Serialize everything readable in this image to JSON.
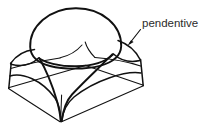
{
  "figure": {
    "kind": "architectural-line-drawing",
    "background_color": "#ffffff",
    "ink_color": "#111111",
    "text_color": "#2b2b2b",
    "annotations": [
      {
        "id": "pendentive",
        "label": "pendentive",
        "text_x": 142,
        "text_y": 27,
        "leader": {
          "from_x": 140,
          "from_y": 29,
          "to_x": 127.5,
          "to_y": 45.5
        },
        "arrow_tip_x": 127.5,
        "arrow_tip_y": 45.5
      }
    ],
    "geometry": {
      "base_square_corners": {
        "left": [
          8.5,
          88.0
        ],
        "front": [
          60.5,
          121.5
        ],
        "right": [
          143.0,
          85.5
        ],
        "back": [
          85.5,
          65.0
        ]
      },
      "impost_corners": {
        "left": [
          12.0,
          62.0
        ],
        "front": [
          62.5,
          93.5
        ],
        "right": [
          140.0,
          58.5
        ],
        "back": [
          86.0,
          40.0
        ]
      },
      "dome_center": [
        75.5,
        33.0
      ],
      "dome_radius_x": 46.0,
      "dome_radius_y": 31.0,
      "dome_springing_line_y": 57.0
    }
  }
}
